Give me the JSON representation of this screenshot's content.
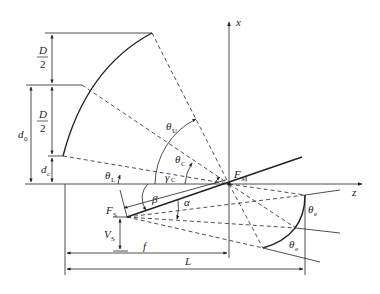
{
  "diagram": {
    "type": "geometric-schematic",
    "axes": {
      "x_axis_label": "x",
      "z_axis_label": "z"
    },
    "points": {
      "main_focus": {
        "label": "F",
        "subscript": "M"
      },
      "sub_focus": {
        "label": "F",
        "subscript": "S"
      }
    },
    "dimensions": {
      "half_D_upper": {
        "numerator": "D",
        "denominator": "2"
      },
      "half_D_lower": {
        "numerator": "D",
        "denominator": "2"
      },
      "d0": {
        "label": "d",
        "subscript": "0"
      },
      "dc": {
        "label": "d",
        "subscript": "c"
      },
      "Vs": {
        "label": "V",
        "subscript": "S"
      },
      "f": {
        "label": "f"
      },
      "L": {
        "label": "L"
      }
    },
    "angles": {
      "theta_U": {
        "label": "θ",
        "subscript": "U"
      },
      "theta_C": {
        "label": "θ",
        "subscript": "C"
      },
      "theta_L": {
        "label": "θ",
        "subscript": "L"
      },
      "gamma_C": {
        "label": "γ",
        "subscript": "C"
      },
      "beta": {
        "label": "β"
      },
      "alpha": {
        "label": "α"
      },
      "theta_e_upper": {
        "label": "θ",
        "subscript": "e"
      },
      "theta_e_lower": {
        "label": "θ",
        "subscript": "e"
      }
    },
    "colors": {
      "stroke": "#222222",
      "background": "#ffffff"
    }
  }
}
